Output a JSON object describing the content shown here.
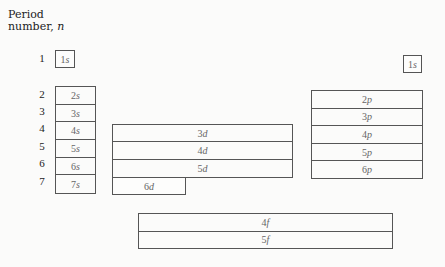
{
  "title": {
    "line1": "Period",
    "line2": "number, ",
    "var": "n"
  },
  "periods": [
    "1",
    "2",
    "3",
    "4",
    "5",
    "6",
    "7"
  ],
  "blocks": {
    "s_period1": {
      "n": "1",
      "l": "s"
    },
    "s": [
      {
        "n": "2",
        "l": "s"
      },
      {
        "n": "3",
        "l": "s"
      },
      {
        "n": "4",
        "l": "s"
      },
      {
        "n": "5",
        "l": "s"
      },
      {
        "n": "6",
        "l": "s"
      },
      {
        "n": "7",
        "l": "s"
      }
    ],
    "d": [
      {
        "n": "3",
        "l": "d"
      },
      {
        "n": "4",
        "l": "d"
      },
      {
        "n": "5",
        "l": "d"
      }
    ],
    "d_last": {
      "n": "6",
      "l": "d"
    },
    "p_period1": {
      "n": "1",
      "l": "s"
    },
    "p": [
      {
        "n": "2",
        "l": "p"
      },
      {
        "n": "3",
        "l": "p"
      },
      {
        "n": "4",
        "l": "p"
      },
      {
        "n": "5",
        "l": "p"
      },
      {
        "n": "6",
        "l": "p"
      }
    ],
    "f": [
      {
        "n": "4",
        "l": "f"
      },
      {
        "n": "5",
        "l": "f"
      }
    ]
  },
  "colors": {
    "border": "#555555",
    "text": "#666666",
    "background": "#fbfbfa"
  }
}
